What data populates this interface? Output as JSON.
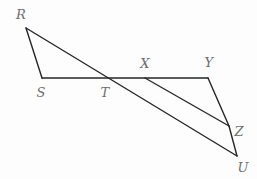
{
  "figure": {
    "background_color": "#fdfdfd",
    "stroke_color": "#262626",
    "label_color": "#6d6d6d",
    "stroke_width": 1.4,
    "width": 257,
    "height": 179
  },
  "points": [
    {
      "id": "R",
      "label": "R",
      "x": 26,
      "y": 28,
      "label_x": 21,
      "label_y": 14
    },
    {
      "id": "S",
      "label": "S",
      "x": 42,
      "y": 78,
      "label_x": 41,
      "label_y": 92
    },
    {
      "id": "T",
      "label": "T",
      "x": 105,
      "y": 78,
      "label_x": 105,
      "label_y": 92
    },
    {
      "id": "X",
      "label": "X",
      "x": 145,
      "y": 78,
      "label_x": 145,
      "label_y": 63
    },
    {
      "id": "Y",
      "label": "Y",
      "x": 208,
      "y": 78,
      "label_x": 209,
      "label_y": 62
    },
    {
      "id": "Z",
      "label": "Z",
      "x": 229,
      "y": 126,
      "label_x": 239,
      "label_y": 131
    },
    {
      "id": "U",
      "label": "U",
      "x": 237,
      "y": 156,
      "label_x": 243,
      "label_y": 167
    }
  ],
  "segments": [
    {
      "id": "RS",
      "name": "segment-RS",
      "from": "R",
      "to": "S"
    },
    {
      "id": "SY",
      "name": "segment-S-to-Y",
      "from": "S",
      "to": "Y"
    },
    {
      "id": "RU",
      "name": "segment-RU-transversal",
      "from": "R",
      "to": "U"
    },
    {
      "id": "XZ",
      "name": "segment-XZ",
      "from": "X",
      "to": "Z"
    },
    {
      "id": "YZ",
      "name": "segment-YZ",
      "from": "Y",
      "to": "Z"
    },
    {
      "id": "ZU",
      "name": "segment-ZU",
      "from": "Z",
      "to": "U"
    }
  ],
  "chart_data": {
    "type": "diagram",
    "shapes": [
      {
        "kind": "triangle",
        "vertices": [
          "R",
          "S",
          "T"
        ]
      },
      {
        "kind": "triangle",
        "vertices": [
          "X",
          "Y",
          "Z"
        ]
      }
    ],
    "lines": [
      {
        "name": "RS",
        "points": [
          [
            26,
            28
          ],
          [
            42,
            78
          ]
        ]
      },
      {
        "name": "SY",
        "points": [
          [
            42,
            78
          ],
          [
            208,
            78
          ]
        ]
      },
      {
        "name": "RU",
        "points": [
          [
            26,
            28
          ],
          [
            237,
            156
          ]
        ]
      },
      {
        "name": "XZ",
        "points": [
          [
            145,
            78
          ],
          [
            229,
            126
          ]
        ]
      },
      {
        "name": "YZ",
        "points": [
          [
            208,
            78
          ],
          [
            229,
            126
          ]
        ]
      },
      {
        "name": "ZU",
        "points": [
          [
            229,
            126
          ],
          [
            237,
            156
          ]
        ]
      }
    ],
    "labels": [
      "R",
      "S",
      "T",
      "X",
      "Y",
      "Z",
      "U"
    ]
  }
}
